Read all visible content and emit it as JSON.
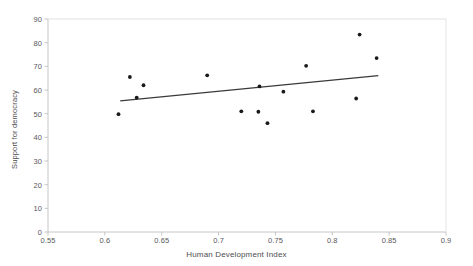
{
  "chart_data": {
    "type": "scatter",
    "title": "",
    "xlabel": "Human Development Index",
    "ylabel": "Support for democracy",
    "xlim": [
      0.55,
      0.9
    ],
    "ylim": [
      0,
      90
    ],
    "xticks": [
      "0.55",
      "0.6",
      "0.65",
      "0.7",
      "0.75",
      "0.8",
      "0.85",
      "0.9"
    ],
    "xtick_values": [
      0.55,
      0.6,
      0.65,
      0.7,
      0.75,
      0.8,
      0.85,
      0.9
    ],
    "yticks": [
      "0",
      "10",
      "20",
      "30",
      "40",
      "50",
      "60",
      "70",
      "80",
      "90"
    ],
    "ytick_values": [
      0,
      10,
      20,
      30,
      40,
      50,
      60,
      70,
      80,
      90
    ],
    "grid": false,
    "legend": "none",
    "marker_color": "#1a1a1a",
    "marker_shape": "circle",
    "axis_color": "#bfbfbf",
    "trendline_color": "#3a3a3a",
    "points": [
      {
        "x": 0.612,
        "y": 49.8
      },
      {
        "x": 0.622,
        "y": 65.5
      },
      {
        "x": 0.628,
        "y": 56.8
      },
      {
        "x": 0.634,
        "y": 62.0
      },
      {
        "x": 0.69,
        "y": 66.2
      },
      {
        "x": 0.72,
        "y": 51.0
      },
      {
        "x": 0.735,
        "y": 50.8
      },
      {
        "x": 0.736,
        "y": 61.5
      },
      {
        "x": 0.743,
        "y": 46.0
      },
      {
        "x": 0.757,
        "y": 59.3
      },
      {
        "x": 0.777,
        "y": 70.2
      },
      {
        "x": 0.783,
        "y": 51.0
      },
      {
        "x": 0.821,
        "y": 56.4
      },
      {
        "x": 0.824,
        "y": 83.4
      },
      {
        "x": 0.839,
        "y": 73.5
      }
    ],
    "trendline": {
      "x0": 0.6135,
      "y0": 55.4,
      "x1": 0.8405,
      "y1": 66.1
    }
  }
}
